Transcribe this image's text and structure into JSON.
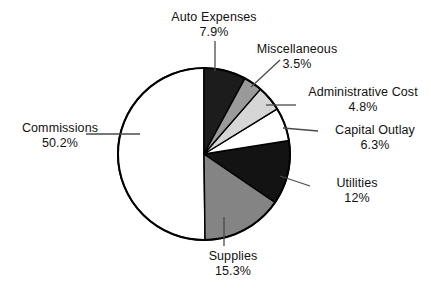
{
  "chart_data": {
    "type": "pie",
    "title": "",
    "subtitle": "",
    "xlabel": "",
    "ylabel": "",
    "legend_position": "callout-labels",
    "grid": false,
    "start_angle_deg": 0,
    "direction": "clockwise",
    "categories": [
      "Auto Expenses",
      "Miscellaneous",
      "Administrative Cost",
      "Capital Outlay",
      "Utilities",
      "Supplies",
      "Commissions"
    ],
    "values": [
      7.9,
      3.5,
      4.8,
      6.3,
      12,
      15.3,
      50.2
    ],
    "value_labels": [
      "7.9%",
      "3.5%",
      "4.8%",
      "6.3%",
      "12%",
      "15.3%",
      "50.2%"
    ],
    "unit": "%",
    "total": 100.0,
    "slice_colors": [
      "#1c1c1c",
      "#9a9a9a",
      "#d6d6d6",
      "#ffffff",
      "#131313",
      "#848484",
      "#ffffff"
    ],
    "slice_stroke": "#000000",
    "slices": [
      {
        "label": "Auto Expenses",
        "value": 7.9,
        "value_label": "7.9%",
        "color": "#1c1c1c"
      },
      {
        "label": "Miscellaneous",
        "value": 3.5,
        "value_label": "3.5%",
        "color": "#9a9a9a"
      },
      {
        "label": "Administrative Cost",
        "value": 4.8,
        "value_label": "4.8%",
        "color": "#d6d6d6"
      },
      {
        "label": "Capital Outlay",
        "value": 6.3,
        "value_label": "6.3%",
        "color": "#ffffff"
      },
      {
        "label": "Utilities",
        "value": 12,
        "value_label": "12%",
        "color": "#131313"
      },
      {
        "label": "Supplies",
        "value": 15.3,
        "value_label": "15.3%",
        "color": "#848484"
      },
      {
        "label": "Commissions",
        "value": 50.2,
        "value_label": "50.2%",
        "color": "#ffffff"
      }
    ]
  },
  "labels": {
    "auto": {
      "category": "Auto Expenses",
      "percent": "7.9%"
    },
    "misc": {
      "category": "Miscellaneous",
      "percent": "3.5%"
    },
    "admin": {
      "category": "Administrative Cost",
      "percent": "4.8%"
    },
    "capital": {
      "category": "Capital Outlay",
      "percent": "6.3%"
    },
    "utilities": {
      "category": "Utilities",
      "percent": "12%"
    },
    "supplies": {
      "category": "Supplies",
      "percent": "15.3%"
    },
    "commissions": {
      "category": "Commissions",
      "percent": "50.2%"
    }
  },
  "colors": {
    "background": "#ffffff",
    "text": "#111111",
    "outline": "#000000",
    "leader_line": "#4a4a4a"
  }
}
